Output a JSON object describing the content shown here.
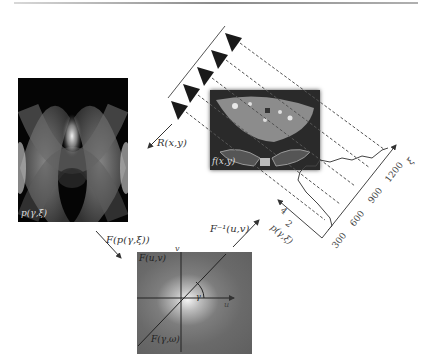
{
  "figure": {
    "panels": {
      "sinogram": {
        "label": "p(γ,ξ)"
      },
      "ct_image": {
        "label": "f(x,y)"
      },
      "fourier_space": {
        "label_top": "F(u,v)",
        "label_bottom": "F(γ,ω)",
        "axis_u": "u",
        "axis_v": "v",
        "angle": "γ"
      }
    },
    "arrows": {
      "radon": "R(x,y)",
      "fourier_transform": "F(p(γ,ξ))",
      "inverse_fourier": "F⁻¹(u,v)"
    },
    "projection_plot": {
      "x_axis_label": "ξ",
      "x_ticks": [
        "300",
        "600",
        "900",
        "1200"
      ],
      "y_axis_label": "p(γ,ξ)",
      "y_ticks": [
        "2",
        "4"
      ]
    },
    "sources": {
      "count": 5
    }
  }
}
